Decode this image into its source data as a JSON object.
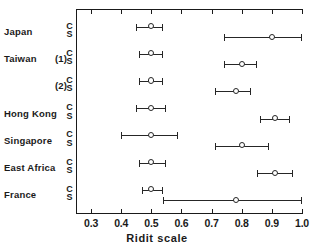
{
  "chart_data": {
    "type": "scatter",
    "title": "",
    "xlabel": "Ridit scale",
    "ylabel": "",
    "xlim": [
      0.25,
      1.0
    ],
    "ylim": [
      0,
      7
    ],
    "grid": false,
    "legend": "none",
    "xticks": [
      0.3,
      0.4,
      0.5,
      0.6,
      0.7,
      0.8,
      0.9,
      1.0
    ],
    "xticklabels": [
      "0.3",
      "0.4",
      "0.5",
      "0.6",
      "0.7",
      "0.8",
      "0.9",
      "1.0"
    ],
    "marker": "open-circle",
    "error_bars": "horizontal 95% confidence intervals with end caps",
    "series_keys": [
      "C",
      "S"
    ],
    "rows": [
      {
        "name": "Japan",
        "paren": "",
        "points": [
          {
            "key": "C",
            "value": 0.5,
            "low": 0.45,
            "high": 0.54
          },
          {
            "key": "S",
            "value": 0.9,
            "low": 0.74,
            "high": 1.0
          }
        ]
      },
      {
        "name": "Taiwan",
        "paren": "(1)",
        "points": [
          {
            "key": "C",
            "value": 0.5,
            "low": 0.46,
            "high": 0.54
          },
          {
            "key": "S",
            "value": 0.8,
            "low": 0.74,
            "high": 0.85
          }
        ]
      },
      {
        "name": "",
        "paren": "(2)",
        "points": [
          {
            "key": "C",
            "value": 0.5,
            "low": 0.46,
            "high": 0.54
          },
          {
            "key": "S",
            "value": 0.78,
            "low": 0.71,
            "high": 0.83
          }
        ]
      },
      {
        "name": "Hong Kong",
        "paren": "",
        "points": [
          {
            "key": "C",
            "value": 0.5,
            "low": 0.45,
            "high": 0.55
          },
          {
            "key": "S",
            "value": 0.91,
            "low": 0.86,
            "high": 0.96
          }
        ]
      },
      {
        "name": "Singapore",
        "paren": "",
        "points": [
          {
            "key": "C",
            "value": 0.5,
            "low": 0.4,
            "high": 0.59
          },
          {
            "key": "S",
            "value": 0.8,
            "low": 0.71,
            "high": 0.89
          }
        ]
      },
      {
        "name": "East  Africa",
        "paren": "",
        "points": [
          {
            "key": "C",
            "value": 0.5,
            "low": 0.46,
            "high": 0.55
          },
          {
            "key": "S",
            "value": 0.91,
            "low": 0.85,
            "high": 0.97
          }
        ]
      },
      {
        "name": "France",
        "paren": "",
        "points": [
          {
            "key": "C",
            "value": 0.5,
            "low": 0.47,
            "high": 0.54
          },
          {
            "key": "S",
            "value": 0.78,
            "low": 0.54,
            "high": 1.0
          }
        ]
      }
    ]
  },
  "colors": {
    "ink": "#1a1a1a",
    "line": "#262626",
    "background": "#ffffff"
  }
}
